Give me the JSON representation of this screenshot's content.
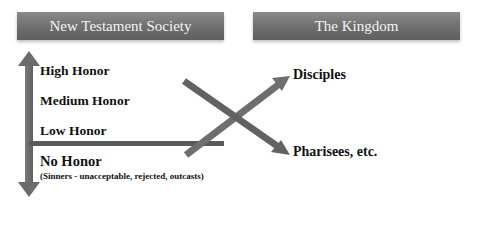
{
  "headers": {
    "left": "New Testament Society",
    "right": "The Kingdom"
  },
  "honor_levels": [
    {
      "label": "High Honor"
    },
    {
      "label": "Medium Honor"
    },
    {
      "label": "Low Honor"
    },
    {
      "label": "No Honor",
      "note": "(Sinners - unacceptable, rejected, outcasts)"
    }
  ],
  "outcomes": {
    "up": "Disciples",
    "down": "Pharisees, etc."
  },
  "colors": {
    "arrow": "#6b6b6b",
    "header_text": "#f4f4f4",
    "text": "#111111"
  }
}
